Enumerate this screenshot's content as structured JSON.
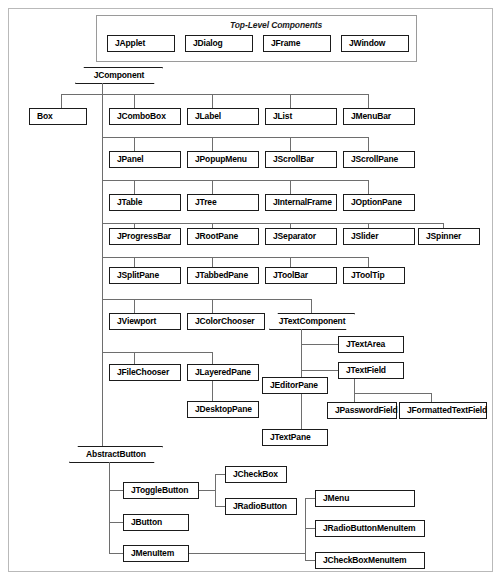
{
  "diagram": {
    "group": {
      "label": "Top-Level Components",
      "members": [
        "JApplet",
        "JDialog",
        "JFrame",
        "JWindow"
      ]
    },
    "abstract_classes": [
      {
        "name": "JComponent"
      },
      {
        "name": "JTextComponent"
      },
      {
        "name": "AbstractButton"
      }
    ],
    "boxes": {
      "box": "Box",
      "japplet": "JApplet",
      "jdialog": "JDialog",
      "jframe": "JFrame",
      "jwindow": "JWindow",
      "jcombobox": "JComboBox",
      "jlabel": "JLabel",
      "jlist": "JList",
      "jmenubar": "JMenuBar",
      "jpanel": "JPanel",
      "jpopupmenu": "JPopupMenu",
      "jscrollbar": "JScrollBar",
      "jscrollpane": "JScrollPane",
      "jtable": "JTable",
      "jtree": "JTree",
      "jinternalframe": "JInternalFrame",
      "joptionpane": "JOptionPane",
      "jprogressbar": "JProgressBar",
      "jrootpane": "JRootPane",
      "jseparator": "JSeparator",
      "jslider": "JSlider",
      "jspinner": "JSpinner",
      "jsplitpane": "JSplitPane",
      "jtabbedpane": "JTabbedPane",
      "jtoolbar": "JToolBar",
      "jtooltip": "JToolTip",
      "jviewport": "JViewport",
      "jcolorchooser": "JColorChooser",
      "jtextcomponent": "JTextComponent",
      "jtextarea": "JTextArea",
      "jfilechooser": "JFileChooser",
      "jlayeredpane": "JLayeredPane",
      "jtextfield": "JTextField",
      "jeditorpane": "JEditorPane",
      "jdesktoppane": "JDesktopPane",
      "jpasswordfield": "JPasswordField",
      "jformattedtextfield": "JFormattedTextField",
      "jtextpane": "JTextPane",
      "jcomponent": "JComponent",
      "abstractbutton": "AbstractButton",
      "jtogglebutton": "JToggleButton",
      "jcheckbox": "JCheckBox",
      "jradiobutton": "JRadioButton",
      "jbutton": "JButton",
      "jmenuitem": "JMenuItem",
      "jmenu": "JMenu",
      "jradiobuttonmenuitem": "JRadioButtonMenuItem",
      "jcheckboxmenuitem": "JCheckBoxMenuItem"
    },
    "colors": {
      "box_border": "#1b1b1b",
      "box_fill": "#ffffff",
      "shadow": "#b0b0b0",
      "connector": "#6e6e6e",
      "frame_border": "#b9b9b9",
      "panel_border": "#9a9a9a"
    }
  }
}
